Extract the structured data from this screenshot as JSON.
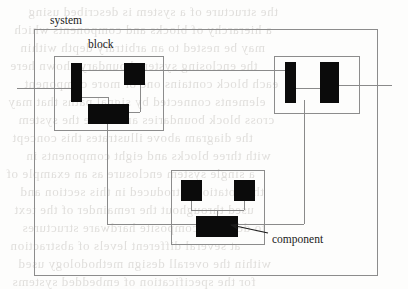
{
  "diagram": {
    "labels": [
      {
        "name": "system-label",
        "text": "system",
        "x": 50,
        "y": 14
      },
      {
        "name": "block-label",
        "text": "block",
        "x": 88,
        "y": 38
      },
      {
        "name": "component-label",
        "text": "component",
        "x": 272,
        "y": 233
      }
    ],
    "colors": {
      "solid_fill": "#0b0b0b",
      "outline": "#8c8c8c",
      "wire": "#8a8a8a",
      "label_text": "#1a1a1a",
      "page_background": "#fdfdfc",
      "ghost_text": "#c9c6c2"
    },
    "outlines": [
      {
        "name": "system-boundary",
        "x": 34,
        "y": 29,
        "w": 344,
        "h": 247
      },
      {
        "name": "block-left-boundary",
        "x": 54,
        "y": 56,
        "w": 110,
        "h": 75
      },
      {
        "name": "block-right-boundary",
        "x": 274,
        "y": 56,
        "w": 86,
        "h": 58
      },
      {
        "name": "block-bottom-boundary",
        "x": 171,
        "y": 170,
        "w": 94,
        "h": 75
      }
    ],
    "components": [
      {
        "name": "component-left-tall",
        "x": 71,
        "y": 63,
        "w": 11,
        "h": 39
      },
      {
        "name": "component-left-square",
        "x": 124,
        "y": 63,
        "w": 21,
        "h": 22
      },
      {
        "name": "component-left-wide",
        "x": 88,
        "y": 104,
        "w": 41,
        "h": 20
      },
      {
        "name": "component-right-thin",
        "x": 285,
        "y": 62,
        "w": 11,
        "h": 41
      },
      {
        "name": "component-right-wide",
        "x": 320,
        "y": 62,
        "w": 19,
        "h": 41
      },
      {
        "name": "component-bottom-sq-left",
        "x": 181,
        "y": 180,
        "w": 21,
        "h": 21
      },
      {
        "name": "component-bottom-sq-right",
        "x": 234,
        "y": 180,
        "w": 21,
        "h": 21
      },
      {
        "name": "component-bottom-wide",
        "x": 196,
        "y": 216,
        "w": 42,
        "h": 21
      }
    ],
    "wires_horizontal": [
      {
        "name": "wire-external-left-in",
        "x": 17,
        "y": 88,
        "w": 55
      },
      {
        "name": "wire-left-tall-to-square",
        "x": 81,
        "y": 70,
        "w": 44
      },
      {
        "name": "wire-left-square-to-right-block",
        "x": 144,
        "y": 70,
        "w": 142
      },
      {
        "name": "wire-left-tall-to-wide",
        "x": 81,
        "y": 97,
        "w": 27
      },
      {
        "name": "wire-wide-to-square-riser",
        "x": 128,
        "y": 112,
        "w": 12
      },
      {
        "name": "wire-right-inner-link",
        "x": 295,
        "y": 88,
        "w": 26
      },
      {
        "name": "wire-external-right-out",
        "x": 338,
        "y": 85,
        "w": 54
      },
      {
        "name": "wire-bottom-left-tee",
        "x": 191,
        "y": 210,
        "w": 53
      },
      {
        "name": "wire-bottom-bus",
        "x": 107,
        "y": 224,
        "w": 197
      }
    ],
    "wires_vertical": [
      {
        "name": "wire-left-tall-riser",
        "x": 108,
        "y": 97,
        "h": 15
      },
      {
        "name": "wire-left-square-dropper",
        "x": 140,
        "y": 70,
        "h": 42
      },
      {
        "name": "wire-left-block-to-bus",
        "x": 107,
        "y": 120,
        "h": 104
      },
      {
        "name": "wire-right-block-to-bus",
        "x": 304,
        "y": 100,
        "h": 124
      },
      {
        "name": "wire-bottom-sq-left-drop",
        "x": 191,
        "y": 201,
        "h": 9
      },
      {
        "name": "wire-bottom-sq-right-drop",
        "x": 244,
        "y": 201,
        "h": 9
      },
      {
        "name": "wire-bottom-tee-to-wide",
        "x": 217,
        "y": 210,
        "h": 6
      }
    ],
    "arrow": {
      "name": "component-callout-arrow",
      "from_x": 268,
      "from_y": 233,
      "to_x": 231,
      "to_y": 225
    }
  },
  "ghost_text": {
    "description": "faint reverse-side bleed-through of scanned page text",
    "lines": [
      {
        "text": "the structure of a system is described using",
        "x": 28,
        "y": 4
      },
      {
        "text": "a hierarchy of blocks and components which",
        "x": 14,
        "y": 22
      },
      {
        "text": "may be nested to an arbitrary depth within",
        "x": 20,
        "y": 40
      },
      {
        "text": "the enclosing system boundary shown here",
        "x": 10,
        "y": 58
      },
      {
        "text": "each block contains one or more component",
        "x": 24,
        "y": 76
      },
      {
        "text": "elements connected by signal paths that may",
        "x": 8,
        "y": 94
      },
      {
        "text": "cross block boundaries and leave the system",
        "x": 18,
        "y": 112
      },
      {
        "text": "the diagram above illustrates this concept",
        "x": 12,
        "y": 130
      },
      {
        "text": "with three blocks and eight components in",
        "x": 26,
        "y": 148
      },
      {
        "text": "a single system enclosure as an example of",
        "x": 6,
        "y": 166
      },
      {
        "text": "the notation introduced in this section and",
        "x": 20,
        "y": 184
      },
      {
        "text": "used throughout the remainder of the text",
        "x": 14,
        "y": 202
      },
      {
        "text": "to describe composite hardware structures",
        "x": 22,
        "y": 220
      },
      {
        "text": "at several different levels of abstraction",
        "x": 10,
        "y": 238
      },
      {
        "text": "within the overall design methodology used",
        "x": 18,
        "y": 256
      },
      {
        "text": "for the specification of embedded systems",
        "x": 12,
        "y": 274
      }
    ]
  }
}
